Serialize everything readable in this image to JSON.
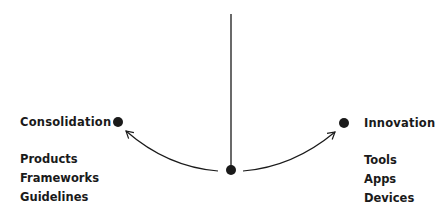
{
  "diagram": {
    "left": {
      "title": "Consolidation",
      "items": [
        "Products",
        "Frameworks",
        "Guidelines"
      ]
    },
    "right": {
      "title": "Innovation",
      "items": [
        "Tools",
        "Apps",
        "Devices"
      ]
    },
    "colors": {
      "ink": "#1a1a1a",
      "background": "#ffffff"
    }
  }
}
